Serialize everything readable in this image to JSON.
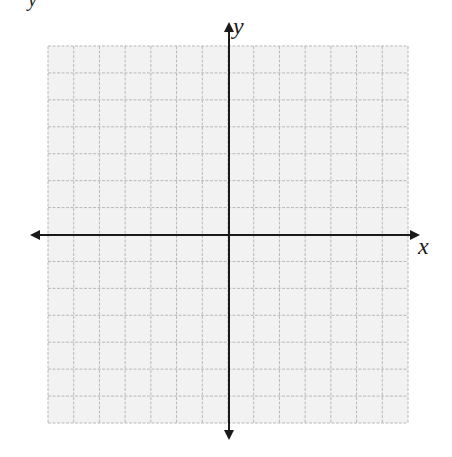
{
  "diagram": {
    "type": "blank coordinate plane",
    "x_axis_label": "x",
    "y_axis_label": "y",
    "corner_fragment": "y",
    "grid": {
      "columns": 14,
      "rows": 14,
      "left": 48,
      "right": 408,
      "top": 46,
      "bottom": 423,
      "fill_color": "#f2f2f2",
      "line_color": "#b8b8b8",
      "line_style": "dashed"
    },
    "origin": {
      "x": 229,
      "y": 235
    },
    "axes": {
      "color": "#1a1a1a",
      "width": 2,
      "x_axis": {
        "from": 30,
        "to": 420,
        "arrows": "both"
      },
      "y_axis": {
        "from": 22,
        "to": 440,
        "arrows": "both"
      }
    }
  }
}
